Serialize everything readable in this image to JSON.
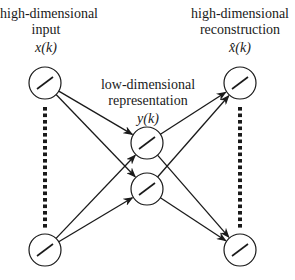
{
  "diagram": {
    "type": "autoencoder-network",
    "input": {
      "title_line1": "high-dimensional",
      "title_line2": "input",
      "symbol": "x(k)"
    },
    "latent": {
      "title_line1": "low-dimensional",
      "title_line2": "representation",
      "symbol": "y(k)"
    },
    "output": {
      "title_line1": "high-dimensional",
      "title_line2": "reconstruction",
      "symbol": "x̂(k)"
    },
    "nodes": [
      {
        "id": "in-top",
        "layer": "input",
        "cx": 45,
        "cy": 83
      },
      {
        "id": "in-bottom",
        "layer": "input",
        "cx": 45,
        "cy": 250
      },
      {
        "id": "latent-top",
        "layer": "latent",
        "cx": 147,
        "cy": 143
      },
      {
        "id": "latent-bottom",
        "layer": "latent",
        "cx": 147,
        "cy": 189
      },
      {
        "id": "out-top",
        "layer": "output",
        "cx": 240,
        "cy": 83
      },
      {
        "id": "out-bottom",
        "layer": "output",
        "cx": 240,
        "cy": 250
      }
    ],
    "edges": [
      [
        "in-top",
        "latent-top"
      ],
      [
        "in-top",
        "latent-bottom"
      ],
      [
        "in-bottom",
        "latent-top"
      ],
      [
        "in-bottom",
        "latent-bottom"
      ],
      [
        "latent-top",
        "out-top"
      ],
      [
        "latent-top",
        "out-bottom"
      ],
      [
        "latent-bottom",
        "out-top"
      ],
      [
        "latent-bottom",
        "out-bottom"
      ]
    ],
    "colors": {
      "stroke": "#1a1a1a",
      "background": "#ffffff"
    }
  }
}
